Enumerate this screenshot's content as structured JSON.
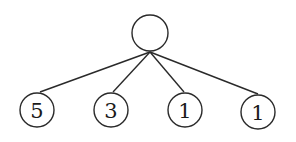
{
  "diagram": {
    "type": "tree",
    "root": {
      "id": "root",
      "label": "",
      "cx": 150,
      "cy": 33,
      "r": 18
    },
    "children": [
      {
        "id": "child-1",
        "label": "5",
        "cx": 37,
        "cy": 110,
        "r": 17,
        "edge_to": [
          40,
          92
        ]
      },
      {
        "id": "child-2",
        "label": "3",
        "cx": 111,
        "cy": 110,
        "r": 17,
        "edge_to": [
          113,
          92
        ]
      },
      {
        "id": "child-3",
        "label": "1",
        "cx": 185,
        "cy": 110,
        "r": 17,
        "edge_to": [
          184,
          92
        ]
      },
      {
        "id": "child-4",
        "label": "1",
        "cx": 258,
        "cy": 112,
        "r": 17,
        "edge_to": [
          258,
          94
        ]
      }
    ],
    "edge_origin": [
      150,
      52
    ]
  }
}
